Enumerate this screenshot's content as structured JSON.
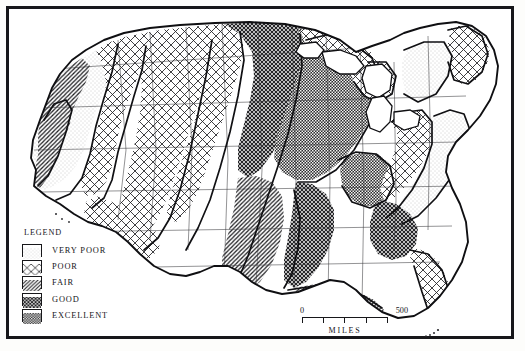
{
  "map": {
    "title": "Soil / Agricultural Productivity Map of the Contiguous United States",
    "projection_note": "",
    "background_color": "#ffffff",
    "line_color": "#17171a"
  },
  "legend": {
    "title": "LEGEND",
    "items": [
      {
        "label": "VERY POOR",
        "pattern": "stipple-light",
        "fill_id": "pat-verypoor"
      },
      {
        "label": "POOR",
        "pattern": "crosshatch-wide",
        "fill_id": "pat-poor"
      },
      {
        "label": "FAIR",
        "pattern": "diagonal-hatch",
        "fill_id": "pat-fair"
      },
      {
        "label": "GOOD",
        "pattern": "crosshatch-dense",
        "fill_id": "pat-good"
      },
      {
        "label": "EXCELLENT",
        "pattern": "checker-dark",
        "fill_id": "pat-excellent"
      }
    ]
  },
  "scale": {
    "min_label": "0",
    "max_label": "500",
    "units_label": "MILES",
    "ticks": [
      0,
      125,
      250,
      375,
      500
    ]
  },
  "regions": [
    {
      "name": "pacific-northwest-coast",
      "class": "VERY POOR"
    },
    {
      "name": "cascade-range",
      "class": "POOR"
    },
    {
      "name": "columbia-plateau",
      "class": "FAIR"
    },
    {
      "name": "great-basin",
      "class": "POOR"
    },
    {
      "name": "california-central-valley",
      "class": "FAIR"
    },
    {
      "name": "southwest-desert",
      "class": "POOR"
    },
    {
      "name": "rocky-mountains",
      "class": "POOR"
    },
    {
      "name": "northern-great-plains",
      "class": "GOOD"
    },
    {
      "name": "corn-belt",
      "class": "EXCELLENT"
    },
    {
      "name": "great-lakes-north",
      "class": "POOR"
    },
    {
      "name": "lower-mississippi-valley",
      "class": "GOOD"
    },
    {
      "name": "southern-plains",
      "class": "FAIR"
    },
    {
      "name": "gulf-coast",
      "class": "FAIR"
    },
    {
      "name": "appalachians",
      "class": "POOR"
    },
    {
      "name": "atlantic-coastal-plain",
      "class": "VERY POOR"
    },
    {
      "name": "northern-new-england",
      "class": "POOR"
    },
    {
      "name": "florida-peninsula",
      "class": "POOR"
    }
  ]
}
